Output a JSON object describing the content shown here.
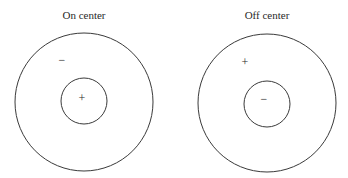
{
  "diagram": {
    "panels": [
      {
        "title": "On center",
        "center_sign": "+",
        "surround_sign": "−"
      },
      {
        "title": "Off center",
        "center_sign": "−",
        "surround_sign": "+"
      }
    ],
    "colors": {
      "stroke": "#3a3a3a",
      "text": "#2a2a2a",
      "background": "#ffffff"
    }
  }
}
